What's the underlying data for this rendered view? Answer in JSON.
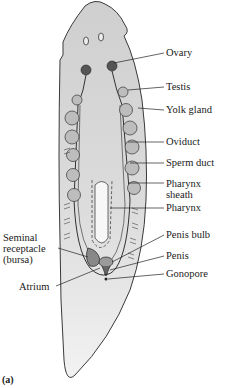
{
  "figure": {
    "caption": "(a)",
    "colors": {
      "body_fill": "#d8d8d8",
      "body_fill_light": "#f0f0f0",
      "outline": "#3a3a3a",
      "organ_fill": "#b8b8b8",
      "ovary_fill": "#555555",
      "leader_line": "#222222"
    }
  },
  "labels": {
    "right": [
      {
        "id": "ovary",
        "text": "Ovary"
      },
      {
        "id": "testis",
        "text": "Testis"
      },
      {
        "id": "yolk_gland",
        "text": "Yolk gland"
      },
      {
        "id": "oviduct",
        "text": "Oviduct"
      },
      {
        "id": "sperm_duct",
        "text": "Sperm duct"
      },
      {
        "id": "pharynx_sheath",
        "text": "Pharynx sheath"
      },
      {
        "id": "pharynx",
        "text": "Pharynx"
      },
      {
        "id": "penis_bulb",
        "text": "Penis bulb"
      },
      {
        "id": "penis",
        "text": "Penis"
      },
      {
        "id": "gonopore",
        "text": "Gonopore"
      }
    ],
    "left": [
      {
        "id": "seminal_receptacle",
        "text": "Seminal receptacle (bursa)"
      },
      {
        "id": "atrium",
        "text": "Atrium"
      }
    ]
  }
}
